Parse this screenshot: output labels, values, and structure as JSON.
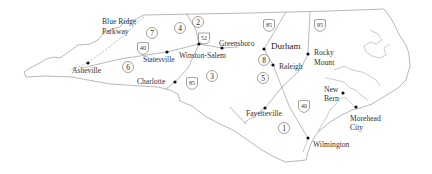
{
  "map": {
    "title": "North Carolina regions map",
    "colors": {
      "border": "#9a9a9a",
      "text": "#333333",
      "dot": "#111111",
      "background": "#ffffff"
    },
    "cities": [
      {
        "name": "Asheville",
        "x": 88,
        "y": 63,
        "label_x": 72,
        "label_y": 73
      },
      {
        "name": "Statesville",
        "x": 167,
        "y": 52,
        "label_x": 143,
        "label_y": 62
      },
      {
        "name": "Winston-Salem",
        "x": 199,
        "y": 44,
        "label_x": 179,
        "label_y": 58
      },
      {
        "name": "Greensboro",
        "x": 222,
        "y": 48,
        "label_x": 218,
        "label_y": 46
      },
      {
        "name": "Charlotte",
        "x": 175,
        "y": 82,
        "label_x": 137,
        "label_y": 84
      },
      {
        "name": "Durham",
        "x": 264,
        "y": 49,
        "label_x": 271,
        "label_y": 49,
        "bold": true
      },
      {
        "name": "Raleigh",
        "x": 273,
        "y": 65,
        "label_x": 279,
        "label_y": 69
      },
      {
        "name": "Rocky",
        "x": 308,
        "y": 54,
        "label_x": 314,
        "label_y": 55
      },
      {
        "name": "Mount",
        "label_x": 314,
        "label_y": 67
      },
      {
        "name": "Fayetteville",
        "x": 265,
        "y": 108,
        "label_x": 246,
        "label_y": 116
      },
      {
        "name": "New",
        "x": 343,
        "y": 93,
        "label_x": 324,
        "label_y": 92
      },
      {
        "name": "Bern",
        "label_x": 324,
        "label_y": 102
      },
      {
        "name": "Morehead",
        "x": 356,
        "y": 107,
        "label_x": 350,
        "label_y": 121
      },
      {
        "name": "City",
        "label_x": 350,
        "label_y": 130
      },
      {
        "name": "Wilmington",
        "x": 308,
        "y": 138,
        "label_x": 313,
        "label_y": 147
      }
    ],
    "regions": [
      {
        "num": "1",
        "x": 284,
        "y": 128
      },
      {
        "num": "2",
        "x": 198,
        "y": 22
      },
      {
        "num": "3",
        "x": 212,
        "y": 76
      },
      {
        "num": "4",
        "x": 180,
        "y": 28
      },
      {
        "num": "5",
        "x": 263,
        "y": 78
      },
      {
        "num": "6",
        "x": 128,
        "y": 67
      },
      {
        "num": "7",
        "x": 152,
        "y": 33
      },
      {
        "num": "8",
        "x": 264,
        "y": 60
      }
    ],
    "highways": [
      {
        "num": "52",
        "x": 204,
        "y": 38
      },
      {
        "num": "40",
        "x": 143,
        "y": 48
      },
      {
        "num": "85",
        "x": 269,
        "y": 25
      },
      {
        "num": "95",
        "x": 320,
        "y": 25
      },
      {
        "num": "85",
        "x": 192,
        "y": 83
      },
      {
        "num": "40",
        "x": 304,
        "y": 106
      }
    ],
    "labels": {
      "parkway_line1": "Blue Ridge",
      "parkway_line2": "Parkway"
    }
  }
}
